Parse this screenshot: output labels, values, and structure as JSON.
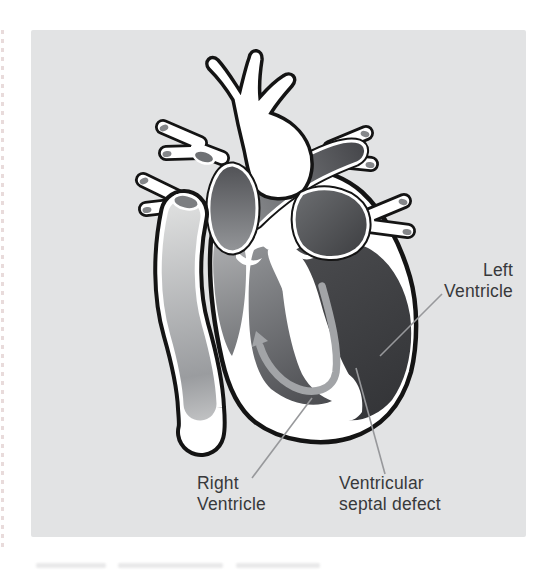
{
  "panel": {
    "bg": "#e2e3e4"
  },
  "labels": {
    "left_ventricle": {
      "line1": "Left",
      "line2": "Ventricle"
    },
    "right_ventricle": {
      "line1": "Right",
      "line2": "Ventricle"
    },
    "vsd": {
      "line1": "Ventricular",
      "line2": "septal defect"
    }
  },
  "colors": {
    "panel_bg": "#e2e3e4",
    "outline": "#141414",
    "chamber_dark": "#3f4043",
    "chamber_mid": "#8f9194",
    "atrium_light": "#aeafb1",
    "vessel_dark": "#4a4b4f",
    "vessel_light": "#d6d7d8",
    "flow_arrow": "#a2a4a7",
    "leader_line": "#97989b",
    "label_text": "#38393b",
    "mouth_oval": "#7c7e81"
  }
}
